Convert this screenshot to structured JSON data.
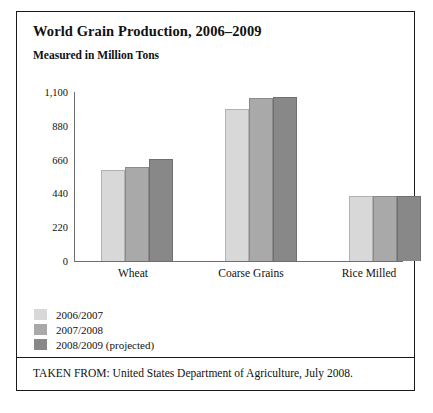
{
  "figure": {
    "title": "World Grain Production, 2006–2009",
    "subtitle": "Measured in Million Tons",
    "footer": "TAKEN FROM: United States Department of Agriculture, July 2008."
  },
  "chart_data": {
    "type": "bar",
    "title": "World Grain Production, 2006–2009",
    "subtitle": "Measured in Million Tons",
    "xlabel": "",
    "ylabel": "Measured in Million Tons",
    "ylim": [
      0,
      1100
    ],
    "yticks": [
      0,
      220,
      440,
      660,
      880,
      1100
    ],
    "ytick_labels": [
      "0",
      "220",
      "440",
      "660",
      "880",
      "1,100"
    ],
    "grid": false,
    "legend_position": "bottom-left",
    "categories": [
      "Wheat",
      "Coarse Grains",
      "Rice Milled"
    ],
    "series": [
      {
        "name": "2006/2007",
        "color": "#d8d8d8",
        "values": [
          592,
          990,
          420
        ]
      },
      {
        "name": "2007/2008",
        "color": "#a9a9a9",
        "values": [
          611,
          1060,
          420
        ]
      },
      {
        "name": "2008/2009 (projected)",
        "color": "#888888",
        "values": [
          663,
          1065,
          420
        ]
      }
    ]
  }
}
